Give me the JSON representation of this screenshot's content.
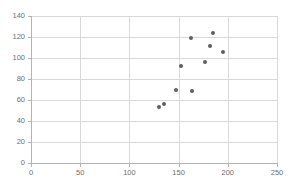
{
  "chart_data": {
    "type": "scatter",
    "title": "",
    "subtitle": "",
    "xlabel": "",
    "ylabel": "",
    "xlim": [
      0,
      250
    ],
    "ylim": [
      0,
      140
    ],
    "grid": true,
    "legend": false,
    "legend_position": "none",
    "xticks": [
      0,
      50,
      100,
      150,
      200,
      250
    ],
    "yticks": [
      0,
      20,
      40,
      60,
      80,
      100,
      120,
      140
    ],
    "xtick_labels": [
      "0",
      "50",
      "100",
      "150",
      "200",
      "250"
    ],
    "ytick_labels": [
      "0",
      "20",
      "40",
      "60",
      "80",
      "100",
      "120",
      "140"
    ],
    "series": [
      {
        "name": "",
        "marker": "circle",
        "color": "#5f5f5f",
        "points": [
          {
            "x": 130,
            "y": 53
          },
          {
            "x": 135,
            "y": 56
          },
          {
            "x": 147,
            "y": 70
          },
          {
            "x": 152,
            "y": 92
          },
          {
            "x": 164,
            "y": 69
          },
          {
            "x": 163,
            "y": 119
          },
          {
            "x": 177,
            "y": 96
          },
          {
            "x": 182,
            "y": 111
          },
          {
            "x": 185,
            "y": 124
          },
          {
            "x": 195,
            "y": 106
          }
        ]
      }
    ]
  },
  "style": {
    "plot_background": "#ffffff",
    "grid_color": "#d9d9d9",
    "axis_color": "#b3b3b3",
    "tick_label_color": "#6e6e6e",
    "marker_color": "#5f5f5f"
  }
}
